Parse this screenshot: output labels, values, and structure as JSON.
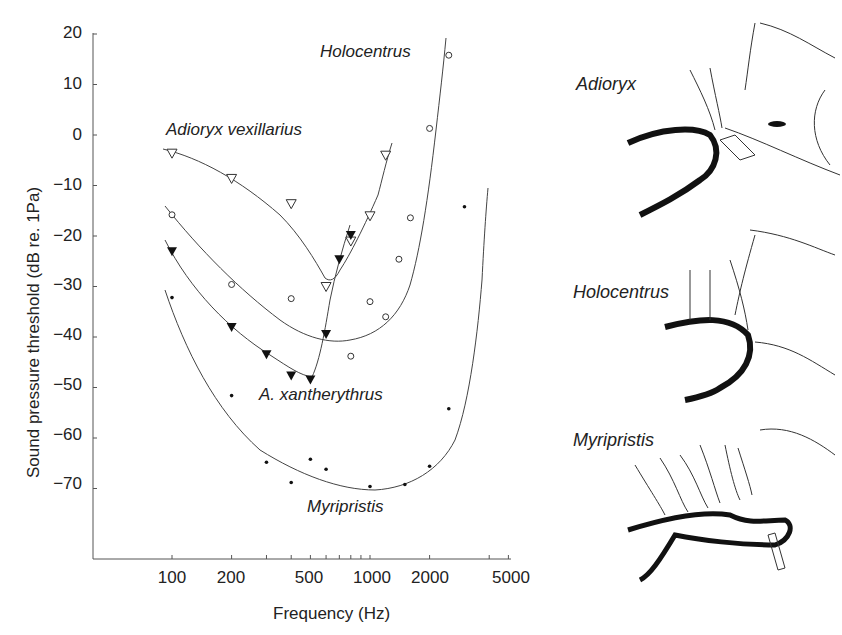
{
  "chart_data": {
    "type": "line",
    "title": "",
    "xlabel": "Frequency (Hz)",
    "ylabel": "Sound pressure threshold (dB re. 1Pa)",
    "xscale": "log",
    "xlim": [
      50,
      5000
    ],
    "ylim": [
      -85,
      20
    ],
    "x_ticks": [
      100,
      200,
      500,
      1000,
      2000,
      5000
    ],
    "y_ticks": [
      20,
      10,
      0,
      -10,
      -20,
      -30,
      -40,
      -50,
      -60,
      -70
    ],
    "grid": false,
    "legend": "inline labels",
    "series": [
      {
        "name": "Adioryx vexillarius",
        "marker": "open-triangle-down",
        "points": [
          [
            100,
            -3.6
          ],
          [
            200,
            -8.6
          ],
          [
            400,
            -13.6
          ],
          [
            600,
            -30
          ],
          [
            800,
            -21
          ],
          [
            1000,
            -16
          ],
          [
            1200,
            -4
          ]
        ]
      },
      {
        "name": "Holocentrus",
        "marker": "open-circle",
        "points": [
          [
            100,
            -15.8
          ],
          [
            200,
            -29.6
          ],
          [
            400,
            -32.4
          ],
          [
            800,
            -43.8
          ],
          [
            1000,
            -33
          ],
          [
            1200,
            -36
          ],
          [
            1400,
            -24.6
          ],
          [
            1600,
            -16.4
          ],
          [
            2000,
            1.3
          ],
          [
            2500,
            15.8
          ]
        ]
      },
      {
        "name": "A. xantherythrus",
        "marker": "filled-triangle-down",
        "points": [
          [
            100,
            -23
          ],
          [
            200,
            -38
          ],
          [
            300,
            -43.4
          ],
          [
            400,
            -47.6
          ],
          [
            500,
            -48.4
          ],
          [
            600,
            -39.4
          ],
          [
            700,
            -24.6
          ],
          [
            800,
            -19.8
          ]
        ]
      },
      {
        "name": "Myripristis",
        "marker": "dot",
        "points": [
          [
            100,
            -32.2
          ],
          [
            200,
            -51.6
          ],
          [
            300,
            -64.8
          ],
          [
            400,
            -68.8
          ],
          [
            500,
            -64.2
          ],
          [
            600,
            -66.2
          ],
          [
            1000,
            -69.6
          ],
          [
            1500,
            -69.2
          ],
          [
            2000,
            -65.6
          ],
          [
            2500,
            -54.2
          ],
          [
            3000,
            -14.2
          ]
        ]
      }
    ]
  },
  "labels": {
    "series": {
      "adioryx": "Adioryx vexillarius",
      "holocentrus": "Holocentrus",
      "xantherythrus": "A. xantherythrus",
      "myripristis": "Myripristis"
    },
    "fish": {
      "adioryx": "Adioryx",
      "holocentrus": "Holocentrus",
      "myripristis": "Myripristis"
    },
    "y_ticks": [
      "20",
      "10",
      "0",
      "−10",
      "−20",
      "−30",
      "−40",
      "−50",
      "−60",
      "−70"
    ],
    "x_ticks": [
      "100",
      "200",
      "500",
      "1000",
      "2000",
      "5000"
    ]
  }
}
